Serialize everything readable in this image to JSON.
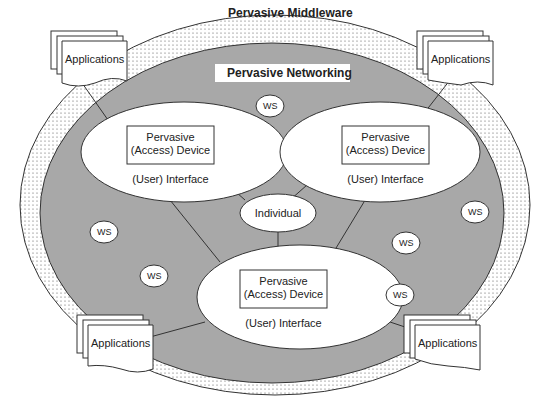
{
  "diagram": {
    "outer_ring_label": "Pervasive Middleware",
    "inner_area_label": "Pervasive Networking",
    "devices": [
      {
        "line1": "Pervasive",
        "line2": "(Access) Device",
        "interface": "(User) Interface"
      },
      {
        "line1": "Pervasive",
        "line2": "(Access) Device",
        "interface": "(User) Interface"
      },
      {
        "line1": "Pervasive",
        "line2": "(Access) Device",
        "interface": "(User) Interface"
      }
    ],
    "center": "Individual",
    "ws_label": "WS",
    "applications": [
      "Applications",
      "Applications",
      "Applications",
      "Applications"
    ],
    "colors": {
      "ring_fill": "#ffffff",
      "network_fill": "#a8a8a8",
      "ellipse_fill": "#ffffff",
      "stroke": "#222222"
    }
  }
}
